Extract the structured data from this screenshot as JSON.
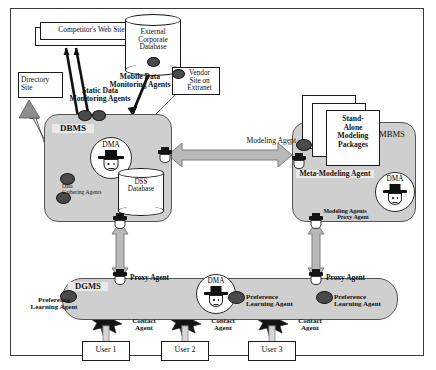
{
  "diagram": {
    "nodes": {
      "competitor_site": "Competitor's Web Site",
      "external_db": "External\nCorporate\nDatabase",
      "vendor_site": "Vendor\nSite on\nExtranet",
      "directory_site": "Directory\nSite",
      "dbms": "DBMS",
      "mbms": "MBMS",
      "dgms": "DGMS",
      "dss_database": "DSS\nDatabase",
      "standalone_packages": "Stand-\nAlone\nModeling\nPackages",
      "user1": "User 1",
      "user2": "User 2",
      "user3": "User 3"
    },
    "agent_labels": {
      "static_data_monitoring": "Static Data\nMonitoring Agents",
      "mobile_data_monitoring": "Mobile Data\nMonitoring Agents",
      "data_gathering": "Data\nGathering Agents",
      "modeling_agent": "Modeling Agent",
      "meta_modeling_agent": "Meta-Modeling Agent",
      "modeling_agents": "Modeling Agents",
      "proxy_agent_mbms": "Proxy Agent",
      "proxy_agent_left": "Proxy Agent",
      "proxy_agent_right": "Proxy Agent",
      "preference_learning_1": "Preference\nLearning Agent",
      "preference_learning_2": "Preference\nLearning Agent",
      "preference_learning_3": "Preference\nLearning Agent",
      "contact_agent_1": "Contact\nAgent",
      "contact_agent_2": "Contact\nAgent",
      "contact_agent_3": "Contact\nAgent",
      "dma_dbms": "DMA",
      "dma_mbms": "DMA",
      "dma_dgms": "DMA"
    },
    "colors": {
      "subsystem_fill": "#cfcfcf",
      "subsystem_stroke": "#555555",
      "agent_fill": "#4a4a4a",
      "arrow_fill": "#b8b8b8",
      "arrow_stroke": "#6e6e6e",
      "box_stroke": "#1a1a1a",
      "frame_stroke": "#3a3a3a",
      "text": "#111111"
    }
  }
}
